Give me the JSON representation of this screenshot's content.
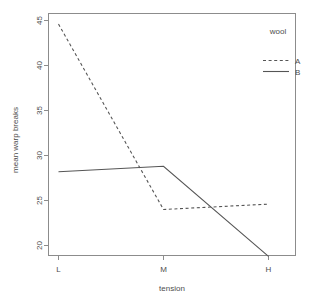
{
  "chart_data": {
    "type": "line",
    "title": "",
    "xlabel": "tension",
    "ylabel": "mean warp breaks",
    "categories": [
      "L",
      "M",
      "H"
    ],
    "x_tick_labels": [
      "L",
      "M",
      "H"
    ],
    "y_tick_labels": [
      "20",
      "25",
      "30",
      "35",
      "40",
      "45"
    ],
    "y_ticks": [
      20,
      25,
      30,
      35,
      40,
      45
    ],
    "ylim": [
      18.2,
      45.6
    ],
    "grid": false,
    "legend_position": "top-right",
    "legend_title": "wool",
    "series": [
      {
        "name": "A",
        "linestyle": "dashed",
        "values": [
          44.6,
          24.0,
          24.6
        ]
      },
      {
        "name": "B",
        "linestyle": "solid",
        "values": [
          28.2,
          28.8,
          18.8
        ]
      }
    ]
  },
  "legend": {
    "title": "wool",
    "entries": [
      {
        "label": "A",
        "style": "dashed"
      },
      {
        "label": "B",
        "style": "solid"
      }
    ]
  },
  "axes": {
    "x_title": "tension",
    "y_title": "mean warp breaks"
  }
}
